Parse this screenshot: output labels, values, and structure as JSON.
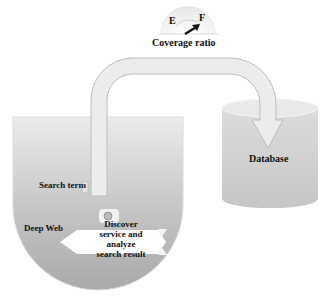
{
  "gauge": {
    "empty_label": "E",
    "full_label": "F",
    "caption": "Coverage ratio"
  },
  "database": {
    "label": "Database"
  },
  "bucket": {
    "label": "Deep Web"
  },
  "pipe": {
    "label": "Search term"
  },
  "probe": {
    "line1": "Discover",
    "line2": "service and",
    "line3": "analyze",
    "line4": "search result"
  },
  "colors": {
    "container_gray": "#b9b9b9",
    "light_gray": "#e6e6e6",
    "outline": "#cfcfcf",
    "text": "#111111"
  }
}
